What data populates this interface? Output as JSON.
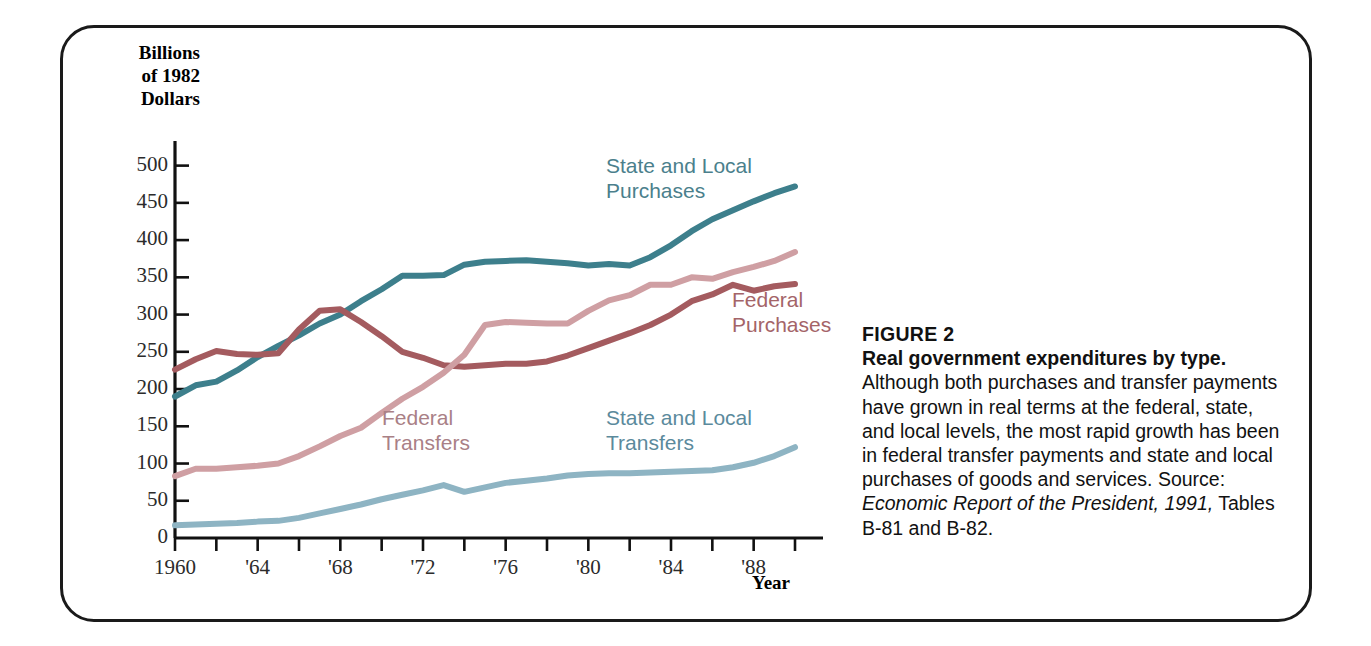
{
  "figure": {
    "number_label": "FIGURE 2",
    "title": "Real government expenditures by type.",
    "body": " Although both purchases and transfer payments have grown in real terms at the federal, state, and local levels, the most rapid growth has been in federal transfer payments and state and local purchases of goods and services.  Source: ",
    "source_italic": "Economic Report of the President, 1991,",
    "source_tail": " Tables B-81 and B-82."
  },
  "chart_data": {
    "type": "line",
    "title": "Real government expenditures by type.",
    "xlabel": "Year",
    "ylabel": "Billions\nof 1982\nDollars",
    "xlim": [
      1960,
      1990
    ],
    "ylim": [
      0,
      525
    ],
    "yticks": [
      0,
      50,
      100,
      150,
      200,
      250,
      300,
      350,
      400,
      450,
      500
    ],
    "ytick_labels": [
      "0",
      "50",
      "100",
      "150",
      "200",
      "250",
      "300",
      "350",
      "400",
      "450",
      "500"
    ],
    "xticks": [
      1960,
      1962,
      1964,
      1966,
      1968,
      1970,
      1972,
      1974,
      1976,
      1978,
      1980,
      1982,
      1984,
      1986,
      1988,
      1990
    ],
    "xtick_labels": [
      {
        "year": 1960,
        "label": "1960"
      },
      {
        "year": 1964,
        "label": "'64"
      },
      {
        "year": 1968,
        "label": "'68"
      },
      {
        "year": 1972,
        "label": "'72"
      },
      {
        "year": 1976,
        "label": "'76"
      },
      {
        "year": 1980,
        "label": "'80"
      },
      {
        "year": 1984,
        "label": "'84"
      },
      {
        "year": 1988,
        "label": "'88"
      }
    ],
    "grid": false,
    "legend_position": "inline-annotations",
    "x": [
      1960,
      1961,
      1962,
      1963,
      1964,
      1965,
      1966,
      1967,
      1968,
      1969,
      1970,
      1971,
      1972,
      1973,
      1974,
      1975,
      1976,
      1977,
      1978,
      1979,
      1980,
      1981,
      1982,
      1983,
      1984,
      1985,
      1986,
      1987,
      1988,
      1989,
      1990
    ],
    "series": [
      {
        "name": "State and Local Purchases",
        "color": "#3d7f8c",
        "label_color": "#4b7f8c",
        "values": [
          190,
          205,
          210,
          225,
          243,
          258,
          272,
          288,
          300,
          318,
          334,
          352,
          352,
          353,
          367,
          371,
          372,
          373,
          371,
          369,
          366,
          368,
          366,
          377,
          393,
          412,
          428,
          440,
          452,
          463,
          472
        ]
      },
      {
        "name": "Federal Purchases",
        "color": "#a45b5f",
        "label_color": "#a46468",
        "values": [
          226,
          240,
          251,
          247,
          246,
          248,
          280,
          305,
          307,
          290,
          271,
          250,
          242,
          232,
          230,
          232,
          234,
          234,
          237,
          245,
          255,
          265,
          275,
          286,
          300,
          318,
          327,
          340,
          332,
          338,
          341
        ]
      },
      {
        "name": "Federal Transfers",
        "color": "#cf9fa3",
        "label_color": "#a98086",
        "values": [
          83,
          93,
          93,
          95,
          97,
          100,
          110,
          123,
          137,
          148,
          168,
          187,
          203,
          222,
          246,
          286,
          290,
          289,
          288,
          288,
          305,
          319,
          326,
          340,
          340,
          350,
          348,
          357,
          364,
          372,
          384
        ]
      },
      {
        "name": "State and Local Transfers",
        "color": "#8eb4c3",
        "label_color": "#5b8a9c",
        "values": [
          17,
          18,
          19,
          20,
          22,
          23,
          27,
          33,
          39,
          45,
          52,
          58,
          64,
          71,
          62,
          68,
          74,
          77,
          80,
          84,
          86,
          87,
          87,
          88,
          89,
          90,
          91,
          95,
          101,
          110,
          122
        ]
      }
    ],
    "annotations": [
      {
        "text": "State and Local\nPurchases",
        "series": "State and Local Purchases"
      },
      {
        "text": "Federal\nPurchases",
        "series": "Federal Purchases"
      },
      {
        "text": "Federal\nTransfers",
        "series": "Federal Transfers"
      },
      {
        "text": "State and Local\nTransfers",
        "series": "State and Local Transfers"
      }
    ]
  }
}
